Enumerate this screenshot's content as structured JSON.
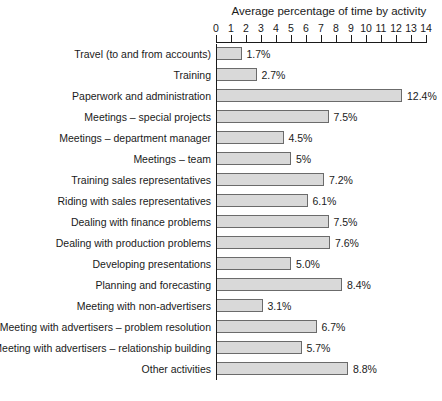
{
  "chart_data": {
    "type": "bar",
    "orientation": "horizontal",
    "title": "Average percentage of time by activity",
    "xlabel": "",
    "ylabel": "",
    "xlim": [
      0,
      14
    ],
    "xticks": [
      0,
      1,
      2,
      3,
      4,
      5,
      6,
      7,
      8,
      9,
      10,
      11,
      12,
      13,
      14
    ],
    "xtick_labels": [
      "0",
      "1",
      "2",
      "3",
      "4",
      "5",
      "6",
      "7",
      "8",
      "9",
      "10",
      "11",
      "12",
      "13",
      "14"
    ],
    "grid": false,
    "legend": null,
    "bar_fill_color": "#d9d9d9",
    "bar_border_color": "#6b6b6b",
    "categories": [
      "Travel (to and from accounts)",
      "Training",
      "Paperwork and administration",
      "Meetings – special projects",
      "Meetings – department manager",
      "Meetings – team",
      "Training sales representatives",
      "Riding with sales representatives",
      "Dealing with finance problems",
      "Dealing with production problems",
      "Developing presentations",
      "Planning and forecasting",
      "Meeting with non-advertisers",
      "Meeting with advertisers – problem resolution",
      "Meeting with advertisers – relationship building",
      "Other activities"
    ],
    "values": [
      1.7,
      2.7,
      12.4,
      7.5,
      4.5,
      5.0,
      7.2,
      6.1,
      7.5,
      7.6,
      5.0,
      8.4,
      3.1,
      6.7,
      5.7,
      8.8
    ],
    "value_labels": [
      "1.7%",
      "2.7%",
      "12.4%",
      "7.5%",
      "4.5%",
      "5%",
      "7.2%",
      "6.1%",
      "7.5%",
      "7.6%",
      "5.0%",
      "8.4%",
      "3.1%",
      "6.7%",
      "5.7%",
      "8.8%"
    ]
  }
}
